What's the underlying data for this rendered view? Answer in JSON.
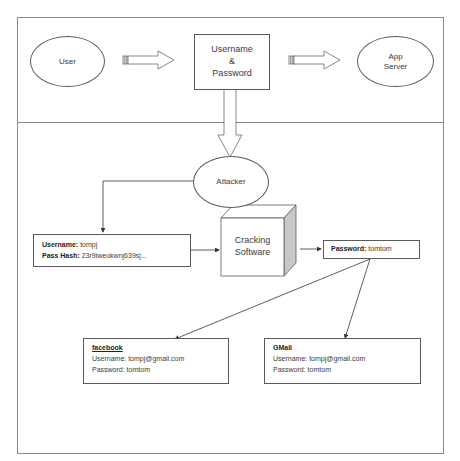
{
  "diagram": {
    "top_row": {
      "user": "User",
      "credentials": [
        "Username",
        "&",
        "Password"
      ],
      "server": [
        "App",
        "Server"
      ]
    },
    "attacker": "Attacker",
    "stolen_record": {
      "username_label": "Username:",
      "username_value": "tompj",
      "hash_label": "Pass Hash:",
      "hash_value": "23r9iweokwnj639sj..."
    },
    "cracker": [
      "Cracking",
      "Software"
    ],
    "cracked": {
      "label": "Password:",
      "value": "tomtom"
    },
    "accounts": [
      {
        "service": "facebook",
        "username_line": "Username: tompj@gmail.com",
        "password_line": "Password: tomtom"
      },
      {
        "service": "GMail",
        "username_line": "Username: tompj@gmail.com",
        "password_line": "Password: tomtom"
      }
    ],
    "colors": {
      "stroke": "#5a5a5a",
      "frame": "#8a8a8a",
      "box_side": "#c8c8c8"
    }
  }
}
